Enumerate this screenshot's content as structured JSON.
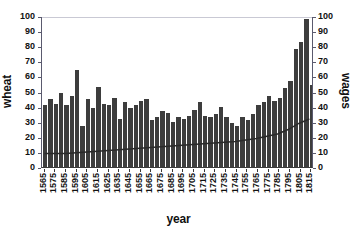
{
  "chart_data": {
    "type": "bar",
    "title": "",
    "xlabel": "year",
    "ylabel": "wheat",
    "ylabel_right": "wages",
    "ylim": [
      0,
      100
    ],
    "y_ticks": [
      0,
      10,
      20,
      30,
      40,
      50,
      60,
      70,
      80,
      90,
      100
    ],
    "y_ticks_right": [
      0,
      10,
      20,
      30,
      40,
      50,
      60,
      70,
      80,
      90,
      100
    ],
    "grid": false,
    "legend": "none",
    "x_tick_labels": [
      "1565",
      "1575",
      "1585",
      "1595",
      "1605",
      "1615",
      "1625",
      "1635",
      "1645",
      "1655",
      "1665",
      "1675",
      "1685",
      "1695",
      "1705",
      "1715",
      "1725",
      "1735",
      "1745",
      "1755",
      "1765",
      "1775",
      "1785",
      "1795",
      "1805",
      "1815"
    ],
    "x_start": 1565,
    "x_step": 5,
    "bar_color": "#3d3d3d",
    "line_color": "#2a2a2a",
    "series": [
      {
        "name": "wheat",
        "type": "bar",
        "axis": "left",
        "x": [
          1565,
          1570,
          1575,
          1580,
          1585,
          1590,
          1595,
          1600,
          1605,
          1610,
          1615,
          1620,
          1625,
          1630,
          1635,
          1640,
          1645,
          1650,
          1655,
          1660,
          1665,
          1670,
          1675,
          1680,
          1685,
          1690,
          1695,
          1700,
          1705,
          1710,
          1715,
          1720,
          1725,
          1730,
          1735,
          1740,
          1745,
          1750,
          1755,
          1760,
          1765,
          1770,
          1775,
          1780,
          1785,
          1790,
          1795,
          1800,
          1805,
          1810,
          1815
        ],
        "values": [
          41,
          45,
          42,
          49,
          41,
          47,
          64,
          27,
          45,
          39,
          53,
          42,
          41,
          46,
          32,
          43,
          39,
          41,
          44,
          45,
          31,
          33,
          37,
          36,
          30,
          33,
          32,
          34,
          38,
          43,
          34,
          33,
          35,
          40,
          33,
          29,
          27,
          33,
          31,
          35,
          41,
          43,
          47,
          44,
          46,
          52,
          57,
          78,
          83,
          98,
          54
        ]
      },
      {
        "name": "wages",
        "type": "line",
        "axis": "right",
        "x": [
          1565,
          1585,
          1605,
          1625,
          1645,
          1665,
          1685,
          1705,
          1725,
          1745,
          1765,
          1785,
          1795,
          1805,
          1815
        ],
        "values": [
          9,
          9,
          10,
          11,
          12,
          13,
          14,
          15,
          16,
          17,
          19,
          22,
          25,
          29,
          32
        ]
      }
    ]
  }
}
